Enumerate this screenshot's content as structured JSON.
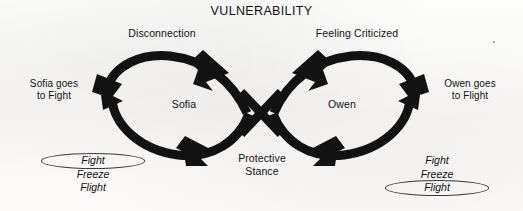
{
  "diagram": {
    "title": "VULNERABILITY",
    "type": "infinity-loop-cycle",
    "ink_color": "#111111",
    "paper_color": "#fbfbfa",
    "center_labels": {
      "left_person": "Sofia",
      "right_person": "Owen"
    },
    "cycle_labels": {
      "top_left": "Disconnection",
      "top_right": "Feeling Criticized",
      "bottom_center": "Protective\nStance"
    },
    "outcome_labels": {
      "left": "Sofia goes\nto Fight",
      "right": "Owen goes\nto Flight"
    },
    "responses_left": {
      "items": [
        {
          "label": "Fight",
          "circled": true
        },
        {
          "label": "Freeze",
          "circled": false
        },
        {
          "label": "Flight",
          "circled": false
        }
      ]
    },
    "responses_right": {
      "items": [
        {
          "label": "Fight",
          "circled": false
        },
        {
          "label": "Freeze",
          "circled": false
        },
        {
          "label": "Flight",
          "circled": true
        }
      ]
    }
  }
}
